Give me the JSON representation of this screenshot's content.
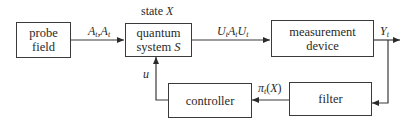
{
  "diagram": {
    "type": "block-diagram",
    "blocks": [
      {
        "id": "probe",
        "label_line1": "probe",
        "label_line2": "field"
      },
      {
        "id": "quantum",
        "label_line1": "quantum",
        "label_line2_text": "system ",
        "label_line2_var": "S",
        "top_label_text": "state ",
        "top_label_var": "X"
      },
      {
        "id": "measure",
        "label_line1": "measurement",
        "label_line2": "device"
      },
      {
        "id": "filter",
        "label": "filter"
      },
      {
        "id": "controller",
        "label": "controller"
      }
    ],
    "edges": [
      {
        "from": "probe",
        "to": "quantum",
        "label": "A_t, A_t†",
        "parts": [
          "A",
          "t",
          ",",
          "A",
          "t"
        ]
      },
      {
        "from": "quantum",
        "to": "measure",
        "label": "U_t A_t U_t",
        "parts": [
          "U",
          "t",
          "A",
          "t",
          "U",
          "t"
        ]
      },
      {
        "from": "measure",
        "to": "output",
        "label": "Y_t",
        "parts": [
          "Y",
          "t"
        ]
      },
      {
        "from": "measure",
        "to": "filter",
        "label": ""
      },
      {
        "from": "filter",
        "to": "controller",
        "label": "π_t(X)",
        "parts": [
          "π",
          "t",
          "(X)"
        ]
      },
      {
        "from": "controller",
        "to": "quantum",
        "label": "u"
      }
    ]
  }
}
